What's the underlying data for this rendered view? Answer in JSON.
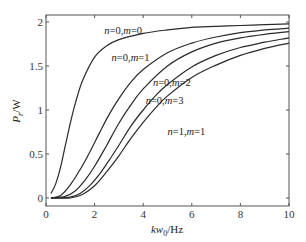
{
  "chart_data": {
    "type": "line",
    "title": "",
    "xlabel": "kw0/Hz",
    "xlabel_main": "kw",
    "xlabel_sub": "0",
    "xlabel_unit": "/Hz",
    "ylabel": "Pr/W",
    "ylabel_main": "P",
    "ylabel_sub": "r",
    "ylabel_unit": "/W",
    "xlim": [
      0,
      10
    ],
    "ylim": [
      -0.1,
      2.1
    ],
    "xticks": [
      0,
      2,
      4,
      6,
      8,
      10
    ],
    "yticks": [
      0,
      0.5,
      1,
      1.5,
      2
    ],
    "xtick_labels": [
      "0",
      "2",
      "4",
      "6",
      "8",
      "10"
    ],
    "ytick_labels": [
      "0",
      "0.5",
      "1",
      "1.5",
      "2"
    ],
    "grid": false,
    "legend": "inline labels",
    "series": [
      {
        "name": "n=0,m=0",
        "label_n": "n",
        "label_n_val": "=0,",
        "label_m": "m",
        "label_m_val": "=0",
        "x": [
          0.2,
          0.4,
          0.6,
          0.8,
          1.0,
          1.2,
          1.5,
          2.0,
          2.5,
          3.0,
          4.0,
          5.0,
          6.0,
          7.0,
          8.0,
          9.0,
          10.0
        ],
        "y": [
          0.05,
          0.16,
          0.35,
          0.6,
          0.85,
          1.07,
          1.33,
          1.6,
          1.73,
          1.8,
          1.87,
          1.91,
          1.94,
          1.95,
          1.96,
          1.97,
          1.98
        ]
      },
      {
        "name": "n=0,m=1",
        "label_n": "n",
        "label_n_val": "=0,",
        "label_m": "m",
        "label_m_val": "=1",
        "x": [
          0.2,
          0.6,
          1.0,
          1.4,
          1.8,
          2.2,
          2.6,
          3.0,
          3.5,
          4.0,
          5.0,
          6.0,
          7.0,
          8.0,
          9.0,
          10.0
        ],
        "y": [
          0.0,
          0.03,
          0.15,
          0.32,
          0.52,
          0.74,
          0.95,
          1.13,
          1.32,
          1.46,
          1.65,
          1.76,
          1.83,
          1.88,
          1.91,
          1.93
        ]
      },
      {
        "name": "n=0,m=2",
        "label_n": "n",
        "label_n_val": "=0,",
        "label_m": "m",
        "label_m_val": "=2",
        "x": [
          0.2,
          0.8,
          1.2,
          1.6,
          2.0,
          2.5,
          3.0,
          3.5,
          4.0,
          5.0,
          6.0,
          7.0,
          8.0,
          9.0,
          10.0
        ],
        "y": [
          0.0,
          0.02,
          0.08,
          0.2,
          0.36,
          0.6,
          0.85,
          1.06,
          1.24,
          1.5,
          1.66,
          1.76,
          1.82,
          1.86,
          1.89
        ]
      },
      {
        "name": "n=0,m=3",
        "label_n": "n",
        "label_n_val": "=0,",
        "label_m": "m",
        "label_m_val": "=3",
        "x": [
          0.2,
          1.0,
          1.4,
          1.8,
          2.2,
          2.6,
          3.0,
          3.5,
          4.0,
          4.5,
          5.0,
          6.0,
          7.0,
          8.0,
          9.0,
          10.0
        ],
        "y": [
          0.0,
          0.01,
          0.05,
          0.14,
          0.27,
          0.43,
          0.6,
          0.82,
          1.0,
          1.16,
          1.29,
          1.49,
          1.62,
          1.71,
          1.77,
          1.82
        ]
      },
      {
        "name": "n=1,m=1",
        "label_n": "n",
        "label_n_val": "=1,",
        "label_m": "m",
        "label_m_val": "=1",
        "x": [
          0.2,
          1.0,
          1.5,
          2.0,
          2.5,
          3.0,
          3.5,
          4.0,
          4.5,
          5.0,
          6.0,
          7.0,
          8.0,
          9.0,
          10.0
        ],
        "y": [
          0.0,
          0.0,
          0.04,
          0.14,
          0.3,
          0.48,
          0.68,
          0.86,
          1.02,
          1.16,
          1.37,
          1.51,
          1.62,
          1.7,
          1.76
        ]
      }
    ],
    "annotations": [
      {
        "text": "n=0,m=0",
        "x": 2.4,
        "y": 1.86
      },
      {
        "text": "n=0,m=1",
        "x": 2.7,
        "y": 1.56
      },
      {
        "text": "n=0,m=2",
        "x": 4.4,
        "y": 1.27
      },
      {
        "text": "n=0,m=3",
        "x": 4.1,
        "y": 1.07
      },
      {
        "text": "n=1,m=1",
        "x": 5.0,
        "y": 0.72
      }
    ]
  },
  "plot_area": {
    "left": 46,
    "top": 15,
    "right": 289,
    "bottom": 206
  },
  "colors": {
    "line": "#2a2a2a",
    "frame": "#555555",
    "text": "#333333",
    "background": "#ffffff"
  }
}
